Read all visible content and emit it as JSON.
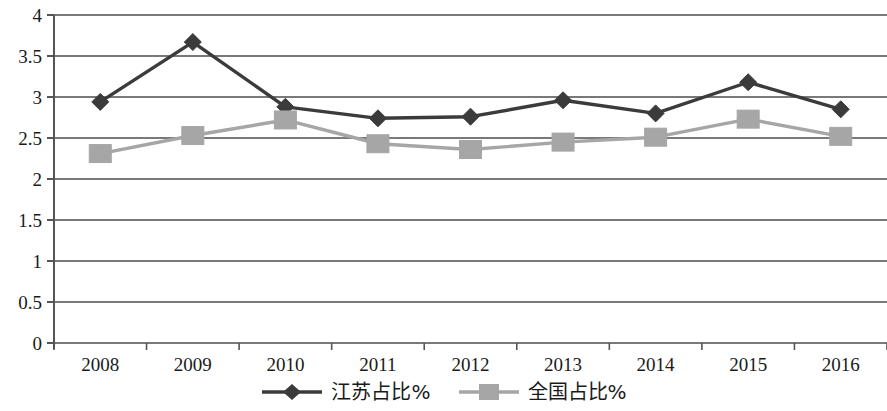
{
  "chart_data": {
    "type": "line",
    "title": "",
    "xlabel": "",
    "ylabel": "",
    "categories": [
      "2008",
      "2009",
      "2010",
      "2011",
      "2012",
      "2013",
      "2014",
      "2015",
      "2016"
    ],
    "ylim": [
      0,
      4
    ],
    "y_ticks": [
      "0",
      "0.5",
      "1",
      "1.5",
      "2",
      "2.5",
      "3",
      "3.5",
      "4"
    ],
    "y_tick_values": [
      0,
      0.5,
      1,
      1.5,
      2,
      2.5,
      3,
      3.5,
      4
    ],
    "grid": true,
    "legend_position": "bottom",
    "series": [
      {
        "name": "江苏占比%",
        "color": "#3b3b3b",
        "marker": "diamond",
        "values": [
          2.94,
          3.67,
          2.88,
          2.74,
          2.76,
          2.96,
          2.8,
          3.18,
          2.85
        ]
      },
      {
        "name": "全国占比%",
        "color": "#a6a6a6",
        "marker": "square",
        "values": [
          2.31,
          2.53,
          2.72,
          2.43,
          2.36,
          2.45,
          2.51,
          2.73,
          2.52
        ]
      }
    ]
  },
  "legend": {
    "items": [
      {
        "label": "江苏占比%",
        "marker": "diamond-marker",
        "color": "#3b3b3b"
      },
      {
        "label": "全国占比%",
        "marker": "square-marker",
        "color": "#a6a6a6"
      }
    ]
  },
  "axes": {
    "axis_color": "#555555",
    "grid_color": "#4d4d4d"
  }
}
